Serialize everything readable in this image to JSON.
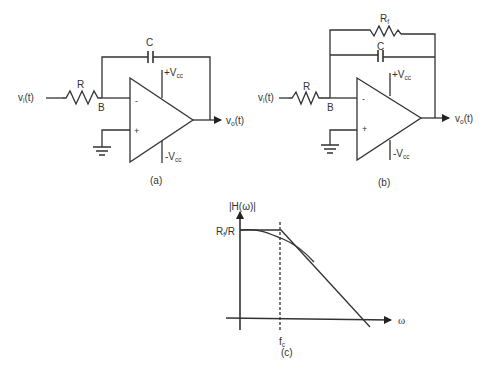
{
  "figure": {
    "panels": [
      {
        "id": "a",
        "caption": "(a)",
        "title": "Op-amp integrator",
        "labels": {
          "input": "v",
          "input_sub": "i",
          "input_suffix": "(t)",
          "resistor": "R",
          "node": "B",
          "capacitor": "C",
          "vplus": "+V",
          "vplus_sub": "cc",
          "vminus": "-V",
          "vminus_sub": "cc",
          "inv_input": "-",
          "noninv_input": "+",
          "output": "v",
          "output_sub": "o",
          "output_suffix": "(t)"
        }
      },
      {
        "id": "b",
        "caption": "(b)",
        "title": "Op-amp lossy integrator (low-pass filter)",
        "labels": {
          "input": "v",
          "input_sub": "i",
          "input_suffix": "(t)",
          "resistor": "R",
          "node": "B",
          "feedback_resistor": "R",
          "feedback_resistor_sub": "f",
          "capacitor": "C",
          "vplus": "+V",
          "vplus_sub": "cc",
          "vminus": "-V",
          "vminus_sub": "cc",
          "inv_input": "-",
          "noninv_input": "+",
          "output": "v",
          "output_sub": "o",
          "output_suffix": "(t)"
        }
      },
      {
        "id": "c",
        "caption": "(c)",
        "title": "Frequency response magnitude",
        "labels": {
          "yaxis": "|H(ω)|",
          "xaxis": "ω",
          "gain_level": "R",
          "gain_level_sub": "f",
          "gain_level_suffix": "/R",
          "cutoff": "f",
          "cutoff_sub": "c"
        }
      }
    ]
  },
  "colors": {
    "line": "#333333",
    "background": "#ffffff"
  }
}
